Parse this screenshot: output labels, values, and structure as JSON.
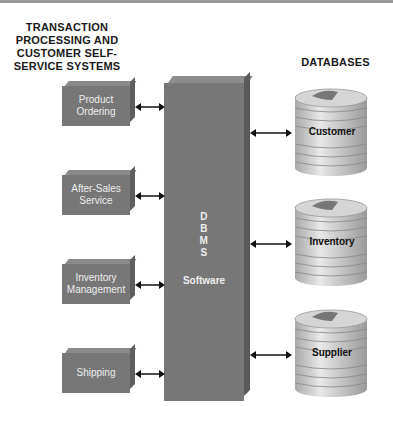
{
  "left_heading": [
    "TRANSACTION",
    "PROCESSING AND",
    "CUSTOMER SELF-",
    "SERVICE SYSTEMS"
  ],
  "right_heading": "DATABASES",
  "systems": [
    {
      "line1": "Product",
      "line2": "Ordering"
    },
    {
      "line1": "After-Sales",
      "line2": "Service"
    },
    {
      "line1": "Inventory",
      "line2": "Management"
    },
    {
      "line1": "Shipping",
      "line2": ""
    }
  ],
  "dbms": {
    "letters": [
      "D",
      "B",
      "M",
      "S"
    ],
    "word": "Software"
  },
  "databases": [
    {
      "label": "Customer"
    },
    {
      "label": "Inventory"
    },
    {
      "label": "Supplier"
    }
  ],
  "colors": {
    "box": "#777777",
    "arrow": "#111111",
    "db_light": "#e6e6e6",
    "db_dark": "#9a9a9a"
  }
}
